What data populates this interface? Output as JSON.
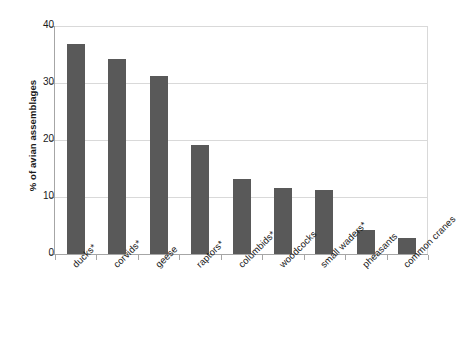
{
  "chart_data": {
    "type": "bar",
    "title": "",
    "subtitle": "",
    "xlabel": "",
    "ylabel": "% of avian assemblages",
    "ylim": [
      0,
      40
    ],
    "yticks": [
      0,
      10,
      20,
      30,
      40
    ],
    "ytick_labels": [
      "0",
      "10",
      "20",
      "30",
      "40"
    ],
    "grid": true,
    "legend": "none",
    "bar_color": "#595959",
    "gridline_color": "#d9d9d9",
    "axis_color": "#a6a6a6",
    "background_color": "#ffffff",
    "categories": [
      "ducks*",
      "corvids*",
      "geese",
      "raptors*",
      "columbids*",
      "woodcocks",
      "small waders*",
      "pheasants",
      "common cranes"
    ],
    "values": [
      36.9,
      34.2,
      31.2,
      19.2,
      13.1,
      11.5,
      11.2,
      4.3,
      2.8
    ],
    "series": [
      {
        "name": "% of avian assemblages",
        "values": [
          36.9,
          34.2,
          31.2,
          19.2,
          13.1,
          11.5,
          11.2,
          4.3,
          2.8
        ]
      }
    ]
  }
}
